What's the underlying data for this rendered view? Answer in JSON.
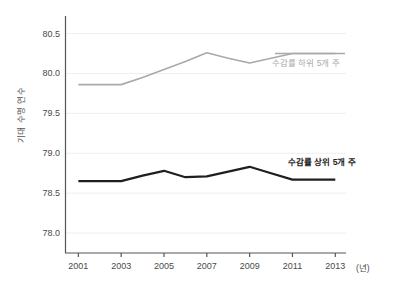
{
  "chart_data": {
    "type": "line",
    "title": "",
    "xlabel": "(년)",
    "ylabel": "기대 수명 연수",
    "x": [
      2001,
      2002,
      2003,
      2004,
      2005,
      2006,
      2007,
      2008,
      2009,
      2010,
      2011,
      2012,
      2013
    ],
    "xtick_labels": [
      "2001",
      "2003",
      "2005",
      "2007",
      "2009",
      "2011",
      "2013"
    ],
    "xticks": [
      2001,
      2003,
      2005,
      2007,
      2009,
      2011,
      2013
    ],
    "ytick_labels": [
      "80.5",
      "80.0",
      "79.5",
      "79.0",
      "78.5",
      "78.0"
    ],
    "yticks": [
      80.5,
      80.0,
      79.5,
      79.0,
      78.5,
      78.0
    ],
    "ylim": [
      77.75,
      80.72
    ],
    "xlim": [
      2000.4,
      2013.5
    ],
    "grid": true,
    "grid_axis": "y",
    "legend": "inline-annotation",
    "series": [
      {
        "name": "수감률 하위 5개 주",
        "color": "#a9a9a9",
        "width": 1.6,
        "values": [
          79.86,
          79.86,
          79.86,
          79.95,
          80.05,
          80.15,
          80.26,
          80.19,
          80.13,
          80.19,
          80.25,
          80.25,
          80.25
        ],
        "label_text": "수감률 하위 5개 주"
      },
      {
        "name": "수감률 상위 5개 주",
        "color": "#1f1f1f",
        "width": 2.2,
        "values": [
          78.65,
          78.65,
          78.65,
          78.72,
          78.78,
          78.7,
          78.71,
          78.77,
          78.83,
          78.75,
          78.67,
          78.67,
          78.67
        ],
        "label_text": "수감률 상위 5개 주"
      }
    ]
  },
  "axes": {
    "y_title": "기대 수명 연수",
    "x_unit": "(년)"
  },
  "colors": {
    "background": "#ffffff",
    "spine": "#555555",
    "grid": "#eeeeee",
    "tick_text": "#4a4a4a",
    "series_low": "#a9a9a9",
    "series_high": "#1f1f1f"
  }
}
